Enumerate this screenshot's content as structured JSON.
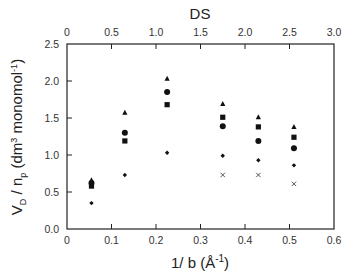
{
  "chart_data": {
    "type": "scatter",
    "title": "",
    "xlabel": "1/ b (Å ⁻¹)",
    "ylabel": "V_D / n_p (dm³ monomol⁻¹)",
    "top_xlabel": "DS",
    "xlim": [
      0,
      0.6
    ],
    "ylim": [
      0,
      2.5
    ],
    "top_xlim": [
      0,
      3.0
    ],
    "xticks": [
      "0",
      "0.1",
      "0.2",
      "0.3",
      "0.4",
      "0.5",
      "0.6"
    ],
    "yticks": [
      "0.0",
      "0.5",
      "1.0",
      "1.5",
      "2.0",
      "2.5"
    ],
    "top_xticks": [
      "0",
      "0.5",
      "1.0",
      "1.5",
      "2.0",
      "2.5",
      "3.0"
    ],
    "grid": false,
    "legend": "none",
    "x": [
      0.055,
      0.13,
      0.225,
      0.35,
      0.43,
      0.51
    ],
    "series": [
      {
        "name": "triangle",
        "marker": "triangle",
        "values": [
          0.66,
          1.57,
          2.03,
          1.69,
          1.51,
          1.38
        ]
      },
      {
        "name": "circle",
        "marker": "circle",
        "values": [
          0.62,
          1.3,
          1.85,
          1.39,
          1.19,
          1.09
        ]
      },
      {
        "name": "square",
        "marker": "square",
        "values": [
          0.58,
          1.19,
          1.68,
          1.51,
          1.38,
          1.24
        ]
      },
      {
        "name": "diamond",
        "marker": "diamond",
        "values": [
          0.35,
          0.73,
          1.03,
          0.99,
          0.93,
          0.86
        ]
      },
      {
        "name": "cross",
        "marker": "x",
        "values": [
          null,
          null,
          null,
          0.73,
          0.73,
          0.61
        ]
      }
    ]
  },
  "labels": {
    "top_axis_title": "DS",
    "bottom_axis_title_main": "1/ b (Å",
    "bottom_axis_title_sup": "-1",
    "bottom_axis_title_close": ")",
    "y_axis_title_V": "V",
    "y_axis_title_D": "D",
    "y_axis_title_slash_n": " / n",
    "y_axis_title_p": "p",
    "y_axis_title_unit": " (dm",
    "y_axis_title_3": "3",
    "y_axis_title_mono": " monomol",
    "y_axis_title_m1": "-1",
    "y_axis_title_close": ")"
  }
}
